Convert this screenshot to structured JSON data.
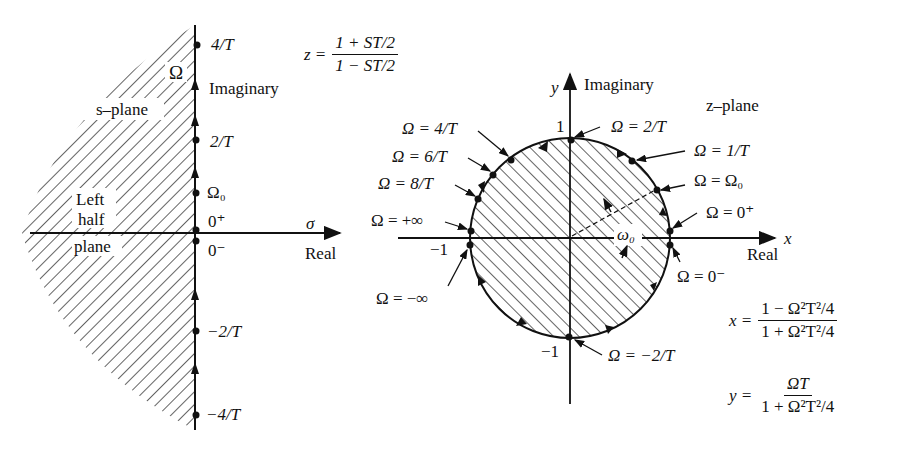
{
  "figure": {
    "s_plane": {
      "name": "s–plane",
      "region_label": [
        "Left",
        "half",
        "plane"
      ],
      "imag_axis_label": "Imaginary",
      "imag_axis_symbol": "Ω",
      "real_axis_label": "Real",
      "real_axis_symbol": "σ",
      "points": [
        {
          "label": "4/T"
        },
        {
          "label": "2/T"
        },
        {
          "label": "Ω₀"
        },
        {
          "label": "0⁺"
        },
        {
          "label": "0⁻"
        },
        {
          "label": "−2/T"
        },
        {
          "label": "−4/T"
        }
      ]
    },
    "mapping_equation": {
      "lhs": "z =",
      "numerator": "1 + ST/2",
      "denominator": "1 − ST/2"
    },
    "z_plane": {
      "name": "z–plane",
      "y_axis_symbol": "y",
      "y_axis_label": "Imaginary",
      "x_axis_symbol": "x",
      "x_axis_label": "Real",
      "tick_labels": {
        "top": "1",
        "left": "−1",
        "bottom": "−1"
      },
      "angle_label": "ω₀",
      "points": [
        {
          "label": "Ω = 4/T"
        },
        {
          "label": "Ω = 6/T"
        },
        {
          "label": "Ω = 8/T"
        },
        {
          "label": "Ω = +∞"
        },
        {
          "label": "Ω = −∞"
        },
        {
          "label": "Ω = 2/T"
        },
        {
          "label": "Ω = 1/T"
        },
        {
          "label": "Ω = Ω₀"
        },
        {
          "label": "Ω = 0⁺"
        },
        {
          "label": "Ω = 0⁻"
        },
        {
          "label": "Ω = −2/T"
        }
      ]
    },
    "x_equation": {
      "lhs": "x =",
      "numerator": "1 − Ω²T²/4",
      "denominator": "1 + Ω²T²/4"
    },
    "y_equation": {
      "lhs": "y =",
      "numerator": "ΩT",
      "denominator": "1 + Ω²T²/4"
    },
    "colors": {
      "ink": "#111111",
      "background": "#ffffff"
    }
  }
}
